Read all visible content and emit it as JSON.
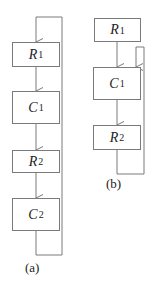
{
  "diagram_a": {
    "caption": "(a)",
    "blocks": [
      {
        "var": "R",
        "sub": "1"
      },
      {
        "var": "C",
        "sub": "1"
      },
      {
        "var": "R",
        "sub": "2"
      },
      {
        "var": "C",
        "sub": "2"
      }
    ],
    "feedback": "output of last block loops back to input of first block"
  },
  "diagram_b": {
    "caption": "(b)",
    "blocks": [
      {
        "var": "R",
        "sub": "1"
      },
      {
        "var": "C",
        "sub": "1"
      },
      {
        "var": "R",
        "sub": "2"
      }
    ],
    "feedback": "output of R2 loops back to input of C1"
  },
  "colors": {
    "line": "#7a7a7a",
    "text": "#222222"
  }
}
